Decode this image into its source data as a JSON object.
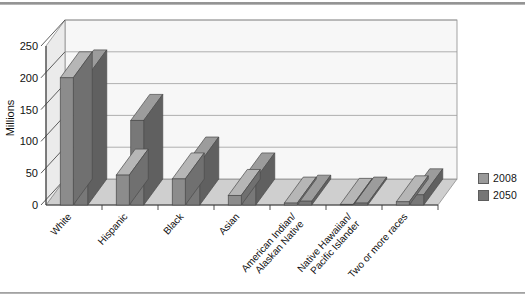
{
  "chart_data": {
    "type": "bar",
    "title": "",
    "subtitle": "",
    "xlabel": "",
    "ylabel": "Millions",
    "ylim": [
      0,
      250
    ],
    "yticks": [
      0,
      50,
      100,
      150,
      200,
      250
    ],
    "ytick_labels": [
      "0",
      "50",
      "100",
      "150",
      "200",
      "250"
    ],
    "grid": true,
    "three_d": true,
    "legend_position": "right",
    "categories": [
      "White",
      "Hispanic",
      "Black",
      "Asian",
      "American Indian/\nAlaskan Native",
      "Native Hawaiian/\nPacific Islander",
      "Two or more races"
    ],
    "category_lines": [
      [
        "White"
      ],
      [
        "Hispanic"
      ],
      [
        "Black"
      ],
      [
        "Asian"
      ],
      [
        "American Indian/",
        "Alaskan Native"
      ],
      [
        "Native Hawaiian/",
        "Pacific Islander"
      ],
      [
        "Two or more races"
      ]
    ],
    "series": [
      {
        "name": "2008",
        "color": "#8c8c8c",
        "values": [
          200,
          47,
          41,
          15,
          3,
          1,
          5
        ]
      },
      {
        "name": "2050",
        "color": "#787878",
        "values": [
          203,
          133,
          66,
          41,
          6,
          3,
          16
        ]
      }
    ]
  },
  "legend": {
    "items": [
      {
        "label": "2008",
        "color": "#9a9a9a"
      },
      {
        "label": "2050",
        "color": "#767676"
      }
    ]
  },
  "axis": {
    "y_title": "Millions"
  }
}
